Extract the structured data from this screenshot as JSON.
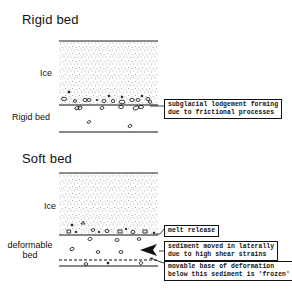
{
  "sections": [
    {
      "id": "rigid",
      "title": "Rigid bed",
      "ice_label": "Ice",
      "bed_label": "Rigid bed",
      "annotations": [
        {
          "id": "lodgement",
          "text_lines": [
            "subglacial lodgement forming",
            "due to frictional processes"
          ]
        }
      ]
    },
    {
      "id": "soft",
      "title": "Soft bed",
      "ice_label": "Ice",
      "bed_label_lines": [
        "deformable",
        "bed"
      ],
      "annotations": [
        {
          "id": "melt",
          "text_lines": [
            "melt release"
          ]
        },
        {
          "id": "sediment",
          "text_lines": [
            "sediment moved in laterally",
            "due to high shear strains"
          ]
        },
        {
          "id": "base",
          "text_lines": [
            "movable base of deformation",
            "below this sediment is 'frozen'"
          ]
        }
      ]
    }
  ],
  "colors": {
    "ink": "#111111",
    "background": "#ffffff",
    "stipple": "#555555"
  }
}
